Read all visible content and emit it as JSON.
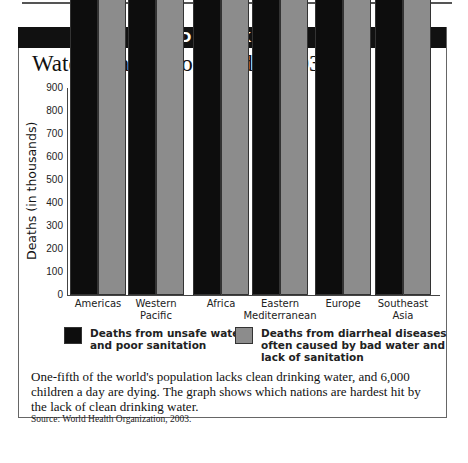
{
  "banner": "DID YOU KNOW?",
  "chart_data": {
    "type": "bar",
    "title": "Water Deaths Worldwide, 2003",
    "xlabel": "",
    "ylabel": "Deaths (in thousands)",
    "ylim": [
      0,
      900
    ],
    "yticks": [
      0,
      100,
      200,
      300,
      400,
      500,
      600,
      700,
      800,
      900
    ],
    "grid": false,
    "legend_position": "bottom",
    "categories": [
      "Americas",
      "Western Pacific",
      "Africa",
      "Eastern Mediterranean",
      "Europe",
      "Southeast Asia"
    ],
    "series": [
      {
        "name": "Deaths from unsafe water and poor sanitation",
        "color": "#0d0d0d",
        "values": [
          55000,
          77000,
          608000,
          270000,
          18000,
          699000
        ],
        "labels": [
          "55,000",
          "77,000",
          "608,000",
          "270,000",
          "18,000",
          "699,000"
        ]
      },
      {
        "name": "Deaths from diarrheal diseases often caused by bad water and lack of sanitation",
        "color": "#8c8c8c",
        "values": [
          76000,
          74000,
          703000,
          336000,
          21000,
          802000
        ],
        "labels": [
          "76,000",
          "74,000",
          "703,000",
          "336,000",
          "21,000",
          "802,000"
        ]
      }
    ]
  },
  "category_lines": [
    [
      "Americas"
    ],
    [
      "Western",
      "Pacific"
    ],
    [
      "Africa"
    ],
    [
      "Eastern",
      "Mediterranean"
    ],
    [
      "Europe"
    ],
    [
      "Southeast",
      "Asia"
    ]
  ],
  "legend": [
    {
      "lines": [
        "Deaths from unsafe water",
        "and poor sanitation"
      ]
    },
    {
      "lines": [
        "Deaths from diarrheal diseases",
        "often caused by bad water and",
        "lack of sanitation"
      ]
    }
  ],
  "caption": "One-fifth of the world's population lacks clean drinking water, and 6,000 children a day are dying. The graph shows which nations are hardest hit by the lack of clean drinking water.",
  "source": "Source: World Health Organization, 2003."
}
